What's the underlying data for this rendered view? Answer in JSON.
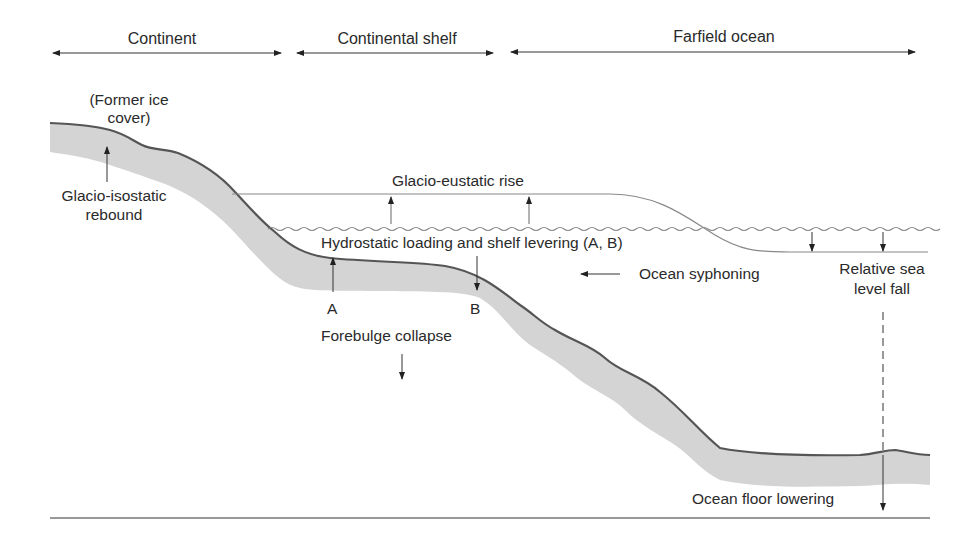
{
  "regions": [
    {
      "label": "Continent",
      "x1": 52,
      "x2": 282
    },
    {
      "label": "Continental shelf",
      "x1": 296,
      "x2": 494
    },
    {
      "label": "Farfield ocean",
      "x1": 510,
      "x2": 916
    }
  ],
  "labels": {
    "former_ice_line1": "(Former ice",
    "former_ice_line2": "cover)",
    "rebound_line1": "Glacio-isostatic",
    "rebound_line2": "rebound",
    "eustatic_rise": "Glacio-eustatic rise",
    "hydrostatic": "Hydrostatic loading and shelf levering (A, B)",
    "syphoning": "Ocean syphoning",
    "rel_sea_line1": "Relative sea",
    "rel_sea_line2": "level fall",
    "point_a": "A",
    "point_b": "B",
    "forebulge": "Forebulge collapse",
    "floor_lowering": "Ocean floor lowering"
  },
  "colors": {
    "crust_fill": "#d4d4d4",
    "crust_edge": "#555555",
    "line": "#333333",
    "sea_line": "#888888"
  }
}
